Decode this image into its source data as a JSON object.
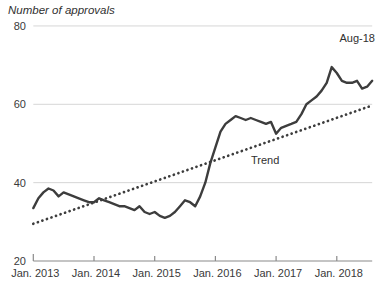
{
  "chart_data": {
    "type": "line",
    "title": "Number of approvals",
    "annotation_end": "Aug-18",
    "trend_label": "Trend",
    "x_tick_labels": [
      "Jan. 2013",
      "Jan. 2014",
      "Jan. 2015",
      "Jan. 2016",
      "Jan. 2017",
      "Jan. 2018"
    ],
    "y_ticks": [
      20,
      40,
      60,
      80
    ],
    "ylim": [
      20,
      80
    ],
    "x_range": [
      "Jan 2013",
      "Aug 2018"
    ],
    "x_unit": "month",
    "grid": "horizontal-only",
    "legend_position": "none",
    "series": [
      {
        "name": "Number of approvals",
        "style": "solid",
        "values": [
          33.5,
          36,
          37.5,
          38.5,
          38,
          36.5,
          37.5,
          37,
          36.5,
          36,
          35.5,
          35,
          35,
          36,
          35.5,
          35,
          34.5,
          34,
          34,
          33.5,
          33,
          34,
          32.5,
          32,
          32.5,
          31.5,
          31,
          31.5,
          32.5,
          34,
          35.5,
          35,
          34,
          36.5,
          40,
          45,
          49,
          53,
          55,
          56,
          57,
          56.5,
          56,
          56.5,
          56,
          55.5,
          55,
          55.5,
          52.5,
          54,
          54.5,
          55,
          55.5,
          57.5,
          60,
          61,
          62,
          63.5,
          65.5,
          69.5,
          68,
          66,
          65.5,
          65.5,
          66,
          64,
          64.5,
          66
        ]
      },
      {
        "name": "Trend",
        "style": "dotted",
        "trend_start": 29.5,
        "trend_end": 59.7
      }
    ],
    "colors": {
      "line": "#3d3d3d",
      "trend": "#3d3d3d",
      "grid": "#d6d6d6",
      "axis": "#8a8a8a",
      "text": "#3a3a3a",
      "background": "#ffffff"
    }
  }
}
